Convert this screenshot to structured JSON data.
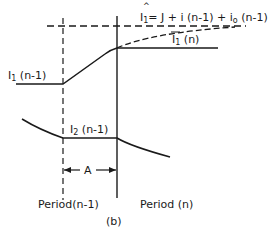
{
  "figure": {
    "caption": "(b)",
    "colors": {
      "ink": "#1a1a1a",
      "background": "#ffffff"
    }
  },
  "labels": {
    "i1_hat_symbol": "I",
    "i1_hat_sub": "1",
    "i1_hat_eq": "= J + i (n-1) + i",
    "i1_hat_sub_o": "o",
    "i1_hat_tail": " (n-1)",
    "i1n_symbol": "I",
    "i1n_sub": "1",
    "i1n_tail": " (n)",
    "i1prev_symbol": "I",
    "i1prev_sub": "1",
    "i1prev_tail": " (n-1)",
    "i2prev_symbol": "I",
    "i2prev_sub": "2",
    "i2prev_tail": " (n-1)",
    "interval_a": "A",
    "period_prev": "Period(n-1)",
    "period_curr": "Period (n)"
  }
}
